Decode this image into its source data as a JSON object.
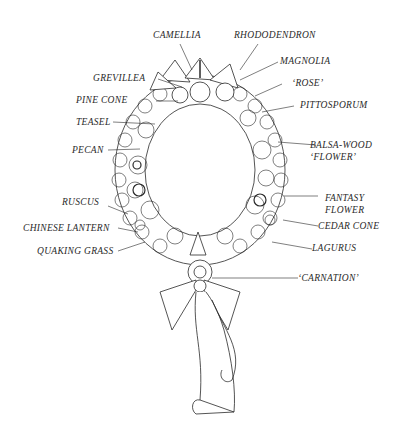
{
  "diagram": {
    "labels": {
      "camellia": "CAMELLIA",
      "rhododendron": "RHODODENDRON",
      "magnolia": "MAGNOLIA",
      "grevillea": "GREVILLEA",
      "rose": "‘ROSE’",
      "pine_cone": "PINE CONE",
      "pittosporum": "PITTOSPORUM",
      "teasel": "TEASEL",
      "pecan": "PECAN",
      "balsa_wood_1": "BALSA-WOOD",
      "balsa_wood_2": "‘FLOWER’",
      "ruscus": "RUSCUS",
      "fantasy_1": "FANTASY",
      "fantasy_2": "FLOWER",
      "chinese_lantern": "CHINESE LANTERN",
      "cedar_cone": "CEDAR CONE",
      "quaking_grass": "QUAKING GRASS",
      "lagurus": "LAGURUS",
      "carnation": "‘CARNATION’"
    },
    "colors": {
      "ink": "#2a2a2a",
      "background": "#ffffff"
    }
  }
}
